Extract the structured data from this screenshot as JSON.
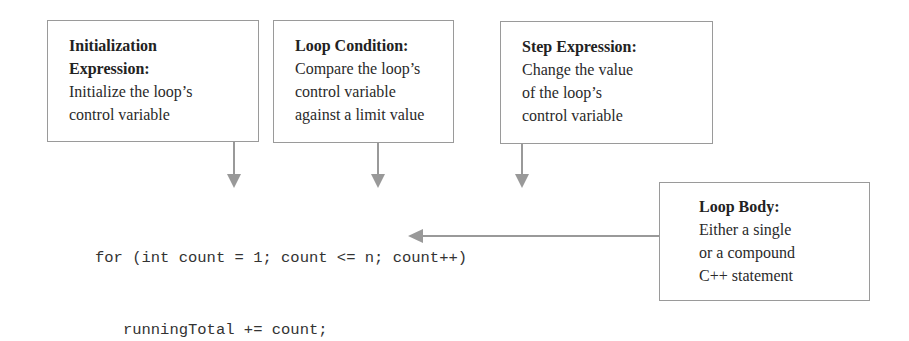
{
  "boxes": {
    "init": {
      "title_lines": [
        "Initialization",
        "Expression:"
      ],
      "body_lines": [
        "Initialize the loop’s",
        "control variable"
      ]
    },
    "condition": {
      "title_lines": [
        "Loop Condition:"
      ],
      "body_lines": [
        "Compare the loop’s",
        "control variable",
        "against a limit value"
      ]
    },
    "step": {
      "title_lines": [
        "Step Expression:"
      ],
      "body_lines": [
        "Change the value",
        "of the loop’s",
        "control variable"
      ]
    },
    "body": {
      "title_lines": [
        "Loop Body:"
      ],
      "body_lines": [
        "Either a single",
        "or a compound",
        "C++ statement"
      ]
    }
  },
  "code": {
    "lines": [
      "for (int count = 1; count <= n; count++)",
      "   runningTotal += count;"
    ]
  },
  "colors": {
    "arrow": "#999999",
    "border": "#9a9a9a",
    "text": "#2a2a2a"
  }
}
